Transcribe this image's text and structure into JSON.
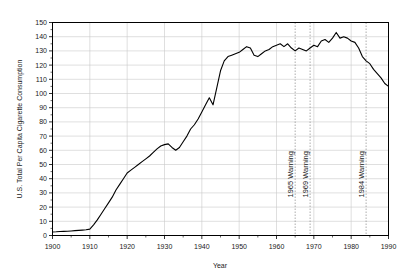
{
  "chart_data": {
    "type": "line",
    "title": "",
    "xlabel": "Year",
    "ylabel": "U.S. Total Per Capita Cigarette Consumption",
    "xlim": [
      1900,
      1990
    ],
    "ylim": [
      0,
      150
    ],
    "grid": true,
    "legend": null,
    "x_ticks": [
      1900,
      1910,
      1920,
      1930,
      1940,
      1950,
      1960,
      1970,
      1980,
      1990
    ],
    "x_tick_labels": [
      "1900",
      "1910",
      "1920",
      "1930",
      "1940",
      "1950",
      "1960",
      "1970",
      "1980",
      "1990"
    ],
    "y_ticks": [
      0,
      10,
      20,
      30,
      40,
      50,
      60,
      70,
      80,
      90,
      100,
      110,
      120,
      130,
      140,
      150
    ],
    "y_tick_labels": [
      "0",
      "10",
      "20",
      "30",
      "40",
      "50",
      "60",
      "70",
      "80",
      "90",
      "100",
      "110",
      "120",
      "130",
      "140",
      "150"
    ],
    "line_color": "#000000",
    "grid_color": "#c9c9c9",
    "series": [
      {
        "name": "U.S. Total Per Capita Cigarette Consumption",
        "x": [
          1900,
          1901,
          1902,
          1903,
          1904,
          1905,
          1906,
          1907,
          1908,
          1909,
          1910,
          1911,
          1912,
          1913,
          1914,
          1915,
          1916,
          1917,
          1918,
          1919,
          1920,
          1921,
          1922,
          1923,
          1924,
          1925,
          1926,
          1927,
          1928,
          1929,
          1930,
          1931,
          1932,
          1933,
          1934,
          1935,
          1936,
          1937,
          1938,
          1939,
          1940,
          1941,
          1942,
          1943,
          1944,
          1945,
          1946,
          1947,
          1948,
          1949,
          1950,
          1951,
          1952,
          1953,
          1954,
          1955,
          1956,
          1957,
          1958,
          1959,
          1960,
          1961,
          1962,
          1963,
          1964,
          1965,
          1966,
          1967,
          1968,
          1969,
          1970,
          1971,
          1972,
          1973,
          1974,
          1975,
          1976,
          1977,
          1978,
          1979,
          1980,
          1981,
          1982,
          1983,
          1984,
          1985,
          1986,
          1987,
          1988,
          1989,
          1990
        ],
        "y": [
          2.5,
          2.6,
          2.8,
          2.9,
          3.0,
          3.2,
          3.4,
          3.6,
          3.8,
          4.0,
          4.5,
          7.5,
          11.0,
          15.0,
          19.0,
          23.0,
          27.0,
          32.0,
          36.0,
          40.0,
          44.0,
          46.0,
          48.0,
          50.0,
          52.0,
          54.0,
          56.0,
          58.5,
          61.0,
          63.0,
          64.0,
          64.5,
          62.0,
          60.0,
          62.0,
          66.0,
          70.0,
          75.0,
          78.0,
          82.0,
          87.0,
          92.0,
          97.0,
          92.0,
          104.0,
          116.0,
          123.0,
          126.0,
          127.0,
          128.0,
          129.0,
          131.0,
          133.0,
          132.0,
          127.0,
          126.0,
          128.0,
          130.0,
          131.0,
          133.0,
          134.0,
          135.0,
          133.0,
          135.0,
          132.0,
          130.0,
          132.0,
          131.0,
          130.0,
          132.0,
          134.0,
          133.0,
          137.0,
          138.0,
          136.0,
          139.0,
          143.0,
          139.0,
          140.0,
          139.0,
          137.0,
          136.0,
          132.0,
          126.0,
          123.0,
          121.0,
          117.0,
          114.0,
          111.0,
          107.0,
          105.0
        ]
      }
    ],
    "annotations": [
      {
        "label": "1965 Warning",
        "x": 1965,
        "orientation": "vertical",
        "line_style": "dotted"
      },
      {
        "label": "1969 Warning",
        "x": 1969,
        "orientation": "vertical",
        "line_style": "dotted"
      },
      {
        "label": "1984 Warning",
        "x": 1984,
        "orientation": "vertical",
        "line_style": "dotted"
      }
    ]
  }
}
